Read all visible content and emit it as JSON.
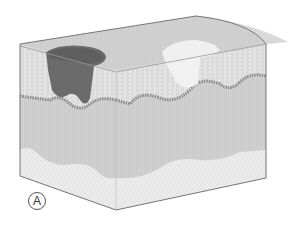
{
  "figure": {
    "type": "3D skin tissue block cross-section",
    "panel_label": "A",
    "colors": {
      "top_surface": "#d6d6d6",
      "front_face": "#cfcfcf",
      "side_face": "#c8c8c8",
      "epidermis_layer": "#e6e6e6",
      "dermal_border": "#8a8a8a",
      "subcutaneous": "#ececec",
      "dark_lesion": "#6b6b6b",
      "light_lesion": "#f3f3f3",
      "outline": "#777777"
    },
    "regions": [
      "dark-lesion",
      "light-lesion",
      "epidermis",
      "dermis",
      "subcutaneous-fat"
    ]
  }
}
